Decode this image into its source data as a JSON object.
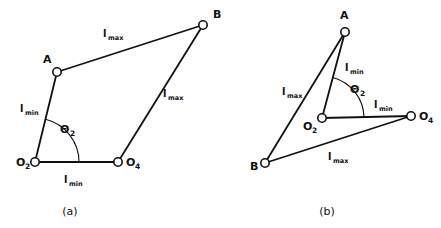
{
  "figure": {
    "background_color": "#ffffff",
    "stroke_color": "#111111",
    "width": 441,
    "height": 228
  },
  "panels": [
    {
      "id": "panel-a",
      "caption": "(a)",
      "caption_pos": {
        "x": 70,
        "y": 215
      },
      "joints": [
        {
          "name": "O2",
          "label": "O",
          "sub": "2",
          "x": 35,
          "y": 162,
          "label_x": 16,
          "label_y": 166,
          "sub_x": 25,
          "sub_y": 169
        },
        {
          "name": "A",
          "label": "A",
          "sub": "",
          "x": 57,
          "y": 72,
          "label_x": 43,
          "label_y": 63,
          "sub_x": 0,
          "sub_y": 0
        },
        {
          "name": "B",
          "label": "B",
          "sub": "",
          "x": 203,
          "y": 25,
          "label_x": 213,
          "label_y": 18,
          "sub_x": 0,
          "sub_y": 0
        },
        {
          "name": "O4",
          "label": "O",
          "sub": "4",
          "x": 118,
          "y": 162,
          "label_x": 126,
          "label_y": 166,
          "sub_x": 135,
          "sub_y": 169
        }
      ],
      "links": [
        {
          "name": "ground-link",
          "from": "O2",
          "to": "O4",
          "label": "l",
          "sub": "min",
          "label_x": 64,
          "label_y": 183,
          "sub_x": 69,
          "sub_y": 186
        },
        {
          "name": "crank-link",
          "from": "O2",
          "to": "A",
          "label": "l",
          "sub": "min",
          "label_x": 20,
          "label_y": 112,
          "sub_x": 25,
          "sub_y": 115
        },
        {
          "name": "coupler-link",
          "from": "A",
          "to": "B",
          "label": "l",
          "sub": "max",
          "label_x": 103,
          "label_y": 37,
          "sub_x": 108,
          "sub_y": 40
        },
        {
          "name": "rocker-link",
          "from": "B",
          "to": "O4",
          "label": "l",
          "sub": "max",
          "label_x": 163,
          "label_y": 97,
          "sub_x": 168,
          "sub_y": 100
        }
      ],
      "angle": {
        "name": "theta-2",
        "label": "Θ",
        "sub": "2",
        "label_x": 60,
        "label_y": 133,
        "sub_x": 70,
        "sub_y": 136,
        "vertex_x": 35,
        "vertex_y": 162,
        "radius": 44
      }
    },
    {
      "id": "panel-b",
      "caption": "(b)",
      "caption_pos": {
        "x": 327,
        "y": 215
      },
      "joints": [
        {
          "name": "O2",
          "label": "O",
          "sub": "2",
          "x": 322,
          "y": 118,
          "label_x": 303,
          "label_y": 130,
          "sub_x": 312,
          "sub_y": 133
        },
        {
          "name": "A",
          "label": "A",
          "sub": "",
          "x": 345,
          "y": 32,
          "label_x": 340,
          "label_y": 19,
          "sub_x": 0,
          "sub_y": 0
        },
        {
          "name": "B",
          "label": "B",
          "sub": "",
          "x": 265,
          "y": 163,
          "label_x": 250,
          "label_y": 170,
          "sub_x": 0,
          "sub_y": 0
        },
        {
          "name": "O4",
          "label": "O",
          "sub": "4",
          "x": 411,
          "y": 116,
          "label_x": 419,
          "label_y": 120,
          "sub_x": 428,
          "sub_y": 123
        }
      ],
      "links": [
        {
          "name": "ground-link",
          "from": "O2",
          "to": "O4",
          "label": "l",
          "sub": "min",
          "label_x": 374,
          "label_y": 108,
          "sub_x": 379,
          "sub_y": 111
        },
        {
          "name": "crank-link",
          "from": "O2",
          "to": "A",
          "label": "l",
          "sub": "min",
          "label_x": 345,
          "label_y": 71,
          "sub_x": 350,
          "sub_y": 74
        },
        {
          "name": "coupler-link",
          "from": "A",
          "to": "B",
          "label": "l",
          "sub": "max",
          "label_x": 282,
          "label_y": 95,
          "sub_x": 287,
          "sub_y": 98
        },
        {
          "name": "rocker-link",
          "from": "B",
          "to": "O4",
          "label": "l",
          "sub": "max",
          "label_x": 328,
          "label_y": 160,
          "sub_x": 333,
          "sub_y": 163
        }
      ],
      "angle": {
        "name": "theta-2",
        "label": "Θ",
        "sub": "2",
        "label_x": 350,
        "label_y": 93,
        "sub_x": 360,
        "sub_y": 96,
        "vertex_x": 322,
        "vertex_y": 118,
        "radius": 42
      }
    }
  ]
}
